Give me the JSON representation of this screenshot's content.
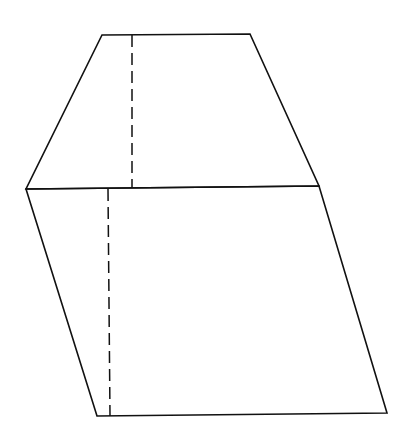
{
  "diagram": {
    "stroke_color": "#111111",
    "background": "#ffffff",
    "shapes": {
      "top_trapezoid": {
        "points": [
          [
            102,
            35
          ],
          [
            250,
            34
          ],
          [
            319,
            186
          ],
          [
            26,
            189
          ]
        ]
      },
      "bottom_parallelogram": {
        "points": [
          [
            26,
            189
          ],
          [
            319,
            186
          ],
          [
            387,
            413
          ],
          [
            97,
            416
          ]
        ]
      }
    },
    "dashed_lines": {
      "upper_height": {
        "x1": 132,
        "y1": 35,
        "x2": 132,
        "y2": 188
      },
      "lower_height": {
        "x1": 108,
        "y1": 189,
        "x2": 110,
        "y2": 416
      }
    }
  }
}
